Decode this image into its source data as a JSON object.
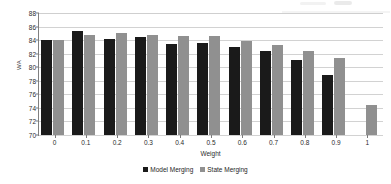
{
  "chart_data": {
    "type": "bar",
    "title": "",
    "subtitle": "",
    "xlabel": "Weight",
    "ylabel": "WA",
    "categories": [
      "0",
      "0.1",
      "0.2",
      "0.3",
      "0.4",
      "0.5",
      "0.6",
      "0.7",
      "0.8",
      "0.9",
      "1"
    ],
    "series": [
      {
        "name": "Model Merging",
        "color": "#1a1a1a",
        "values": [
          84.0,
          85.3,
          84.1,
          84.4,
          83.5,
          83.6,
          83.0,
          82.4,
          81.1,
          78.9,
          null
        ]
      },
      {
        "name": "State Merging",
        "color": "#909090",
        "values": [
          84.0,
          84.75,
          85.0,
          84.8,
          84.65,
          84.65,
          83.85,
          83.25,
          82.45,
          81.3,
          74.5
        ]
      }
    ],
    "ylim": [
      70,
      88
    ],
    "ytick_step": 2,
    "yticks": [
      88,
      86,
      84,
      82,
      80,
      78,
      76,
      74,
      72,
      70
    ],
    "ytick_labels": [
      "88",
      "86",
      "84",
      "82",
      "80",
      "78",
      "76",
      "74",
      "72",
      "70"
    ],
    "grid": true,
    "grid_axis": "y",
    "legend_position": "bottom",
    "bar_orientation": "vertical",
    "group_mode": "grouped"
  },
  "axes": {
    "y_title": "WA",
    "x_title": "Weight"
  },
  "legend": {
    "items": [
      {
        "label": "Model Merging",
        "color": "#1a1a1a"
      },
      {
        "label": "State Merging",
        "color": "#909090"
      }
    ]
  },
  "colors": {
    "series_model_merging": "#1a1a1a",
    "series_state_merging": "#909090",
    "gridline": "#d2d2d2",
    "axis": "#808080",
    "background": "#ffffff",
    "text": "#2b2b2b"
  }
}
